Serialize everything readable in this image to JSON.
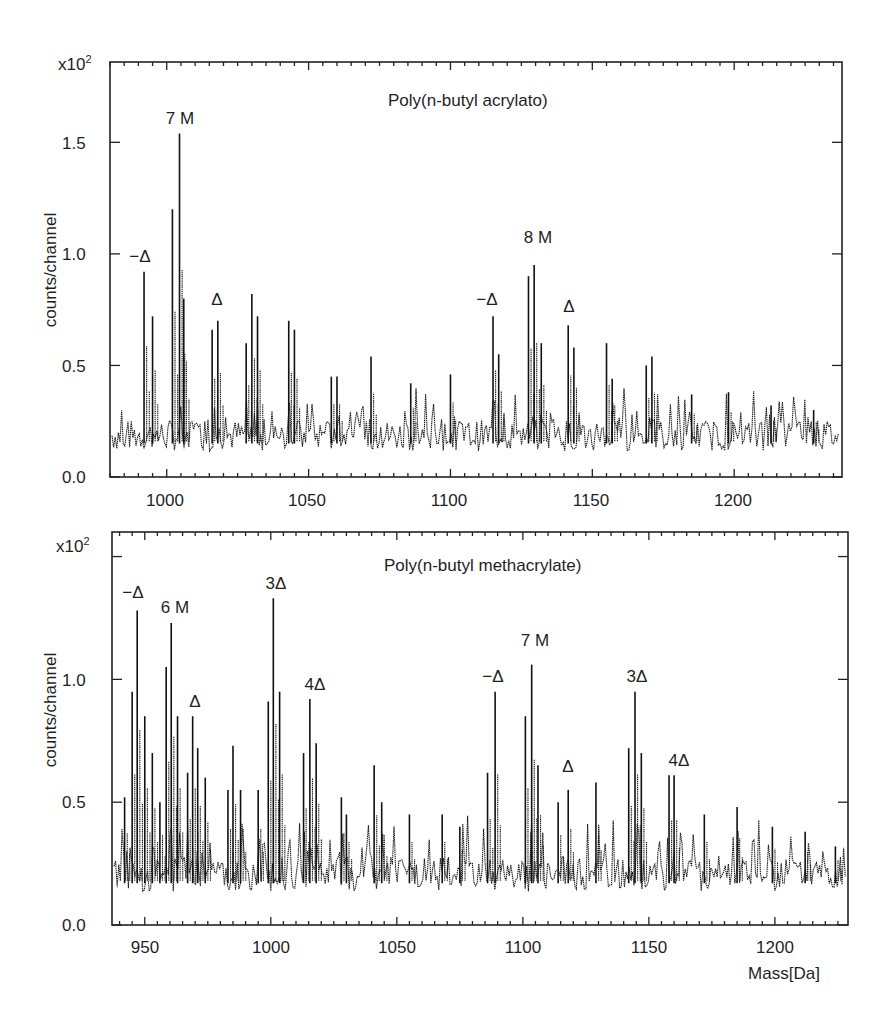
{
  "chart_data": [
    {
      "type": "line",
      "title": "Poly(n-butyl acrylato)",
      "xlabel": "",
      "ylabel": "counts/channel",
      "y_multiplier": "x10²",
      "xlim": [
        980,
        1238
      ],
      "ylim": [
        0.0,
        1.86
      ],
      "xticks": [
        1000,
        1050,
        1100,
        1150,
        1200
      ],
      "yticks": [
        0.0,
        0.5,
        1.0,
        1.5
      ],
      "ytick_labels": [
        "0.0",
        "0.5",
        "1.0",
        "1.5"
      ],
      "grid": false,
      "legend": null,
      "baseline_level": 0.18,
      "peaks": [
        {
          "x": 992,
          "y": 0.92
        },
        {
          "x": 995,
          "y": 0.72
        },
        {
          "x": 1002,
          "y": 1.2
        },
        {
          "x": 1004.5,
          "y": 1.54
        },
        {
          "x": 1006,
          "y": 0.8
        },
        {
          "x": 1016,
          "y": 0.66
        },
        {
          "x": 1018,
          "y": 0.7
        },
        {
          "x": 1028,
          "y": 0.6
        },
        {
          "x": 1030,
          "y": 0.82
        },
        {
          "x": 1032,
          "y": 0.72
        },
        {
          "x": 1043,
          "y": 0.7
        },
        {
          "x": 1045,
          "y": 0.66
        },
        {
          "x": 1058,
          "y": 0.45
        },
        {
          "x": 1060,
          "y": 0.45
        },
        {
          "x": 1072,
          "y": 0.54
        },
        {
          "x": 1086,
          "y": 0.42
        },
        {
          "x": 1100,
          "y": 0.46
        },
        {
          "x": 1115,
          "y": 0.72
        },
        {
          "x": 1117,
          "y": 0.55
        },
        {
          "x": 1127.5,
          "y": 0.9
        },
        {
          "x": 1129.5,
          "y": 0.95
        },
        {
          "x": 1132,
          "y": 0.6
        },
        {
          "x": 1141.5,
          "y": 0.68
        },
        {
          "x": 1143.5,
          "y": 0.58
        },
        {
          "x": 1155,
          "y": 0.6
        },
        {
          "x": 1157,
          "y": 0.44
        },
        {
          "x": 1169,
          "y": 0.5
        },
        {
          "x": 1171,
          "y": 0.54
        },
        {
          "x": 1185,
          "y": 0.37
        },
        {
          "x": 1198,
          "y": 0.38
        },
        {
          "x": 1213,
          "y": 0.32
        },
        {
          "x": 1228,
          "y": 0.3
        }
      ],
      "annotations": [
        {
          "text": "7 M",
          "x": 1004.5,
          "y": 1.65
        },
        {
          "text": "−Δ",
          "x": 991,
          "y": 1.0
        },
        {
          "text": "Δ",
          "x": 1017,
          "y": 0.78
        },
        {
          "text": "8 M",
          "x": 1131,
          "y": 1.07
        },
        {
          "text": "−Δ",
          "x": 1114,
          "y": 0.8
        },
        {
          "text": "Δ",
          "x": 1142,
          "y": 0.76
        }
      ]
    },
    {
      "type": "line",
      "title": "Poly(n-butyl methacrylate)",
      "xlabel": "Mass[Da]",
      "ylabel": "counts/channel",
      "y_multiplier": "x10²",
      "xlim": [
        937,
        1229
      ],
      "ylim": [
        0.0,
        1.6
      ],
      "xticks": [
        950,
        1000,
        1050,
        1100,
        1150,
        1200
      ],
      "yticks": [
        0.0,
        0.5,
        1.0,
        1.5
      ],
      "ytick_labels": [
        "0.0",
        "0.5",
        "1.0",
        ""
      ],
      "grid": false,
      "legend": null,
      "baseline_level": 0.2,
      "peaks": [
        {
          "x": 942,
          "y": 0.52
        },
        {
          "x": 945,
          "y": 0.95
        },
        {
          "x": 947,
          "y": 1.28
        },
        {
          "x": 950,
          "y": 0.85
        },
        {
          "x": 953,
          "y": 0.7
        },
        {
          "x": 956,
          "y": 0.5
        },
        {
          "x": 958.5,
          "y": 1.05
        },
        {
          "x": 960.5,
          "y": 1.23
        },
        {
          "x": 963,
          "y": 0.85
        },
        {
          "x": 967,
          "y": 0.62
        },
        {
          "x": 969,
          "y": 0.85
        },
        {
          "x": 971,
          "y": 0.72
        },
        {
          "x": 974,
          "y": 0.6
        },
        {
          "x": 983,
          "y": 0.55
        },
        {
          "x": 985,
          "y": 0.73
        },
        {
          "x": 988,
          "y": 0.55
        },
        {
          "x": 995,
          "y": 0.55
        },
        {
          "x": 999,
          "y": 0.91
        },
        {
          "x": 1001,
          "y": 1.33
        },
        {
          "x": 1003.5,
          "y": 0.95
        },
        {
          "x": 1013,
          "y": 0.7
        },
        {
          "x": 1015.5,
          "y": 0.92
        },
        {
          "x": 1018,
          "y": 0.74
        },
        {
          "x": 1028,
          "y": 0.52
        },
        {
          "x": 1030,
          "y": 0.45
        },
        {
          "x": 1041,
          "y": 0.65
        },
        {
          "x": 1044,
          "y": 0.5
        },
        {
          "x": 1055,
          "y": 0.45
        },
        {
          "x": 1068,
          "y": 0.45
        },
        {
          "x": 1075,
          "y": 0.4
        },
        {
          "x": 1086,
          "y": 0.62
        },
        {
          "x": 1089,
          "y": 0.95
        },
        {
          "x": 1101,
          "y": 0.85
        },
        {
          "x": 1103.5,
          "y": 1.06
        },
        {
          "x": 1106,
          "y": 0.65
        },
        {
          "x": 1114,
          "y": 0.5
        },
        {
          "x": 1118,
          "y": 0.55
        },
        {
          "x": 1129,
          "y": 0.58
        },
        {
          "x": 1142,
          "y": 0.72
        },
        {
          "x": 1144.5,
          "y": 0.95
        },
        {
          "x": 1147,
          "y": 0.7
        },
        {
          "x": 1158,
          "y": 0.61
        },
        {
          "x": 1160,
          "y": 0.61
        },
        {
          "x": 1172,
          "y": 0.45
        },
        {
          "x": 1185,
          "y": 0.48
        },
        {
          "x": 1199,
          "y": 0.4
        },
        {
          "x": 1212,
          "y": 0.38
        },
        {
          "x": 1224,
          "y": 0.32
        }
      ],
      "annotations": [
        {
          "text": "−Δ",
          "x": 946,
          "y": 1.4
        },
        {
          "text": "6 M",
          "x": 962,
          "y": 1.31
        },
        {
          "text": "Δ",
          "x": 969,
          "y": 0.93
        },
        {
          "text": "3Δ",
          "x": 1001,
          "y": 1.42
        },
        {
          "text": "4Δ",
          "x": 1016,
          "y": 1.0
        },
        {
          "text": "−Δ",
          "x": 1088,
          "y": 1.03
        },
        {
          "text": "7 M",
          "x": 1104,
          "y": 1.15
        },
        {
          "text": "Δ",
          "x": 1118,
          "y": 0.63
        },
        {
          "text": "3Δ",
          "x": 1144,
          "y": 1.03
        },
        {
          "text": "4Δ",
          "x": 1160,
          "y": 0.69
        }
      ]
    }
  ],
  "panels": {
    "top": {
      "title": "Poly(n-butyl acrylato)",
      "ylabel": "counts/channel",
      "multiplier": "x10",
      "multiplier_exp": "2",
      "yticks": [
        "1.5",
        "1.0",
        "0.5",
        "0.0"
      ],
      "xticks": [
        "1000",
        "1050",
        "1100",
        "1150",
        "1200"
      ],
      "annotations": [
        "7 M",
        "−Δ",
        "Δ",
        "8 M",
        "−Δ",
        "Δ"
      ]
    },
    "bottom": {
      "title": "Poly(n-butyl methacrylate)",
      "ylabel": "counts/channel",
      "xlabel": "Mass[Da]",
      "multiplier": "x10",
      "multiplier_exp": "2",
      "yticks": [
        "1.0",
        "0.5",
        "0.0"
      ],
      "xticks": [
        "950",
        "1000",
        "1050",
        "1100",
        "1150",
        "1200"
      ],
      "annotations": [
        "−Δ",
        "6 M",
        "Δ",
        "3Δ",
        "4Δ",
        "−Δ",
        "7 M",
        "Δ",
        "3Δ",
        "4Δ"
      ]
    }
  }
}
